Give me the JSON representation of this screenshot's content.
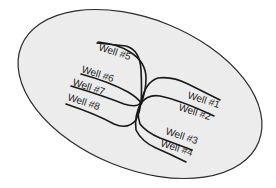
{
  "diagram": {
    "type": "multi-lateral well pad plan view",
    "field_fill": "#ececec",
    "field_stroke": "#2a2a2a",
    "line_color": "#1a1a1a",
    "pad_center": [
      141,
      103
    ],
    "wells": [
      {
        "id": 1,
        "label": "Well #1"
      },
      {
        "id": 2,
        "label": "Well #2"
      },
      {
        "id": 3,
        "label": "Well #3"
      },
      {
        "id": 4,
        "label": "Well #4"
      },
      {
        "id": 5,
        "label": "Well #5"
      },
      {
        "id": 6,
        "label": "Well #6"
      },
      {
        "id": 7,
        "label": "Well #7"
      },
      {
        "id": 8,
        "label": "Well #8"
      }
    ]
  }
}
